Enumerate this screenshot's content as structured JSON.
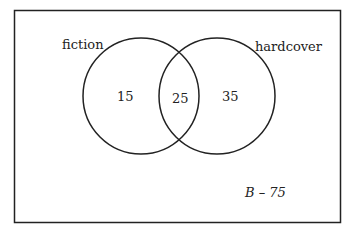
{
  "diagram": {
    "type": "venn",
    "sets": [
      {
        "label": "fiction",
        "only_value": "15"
      },
      {
        "label": "hardcover",
        "only_value": "35"
      }
    ],
    "intersection_value": "25",
    "outside_label": "B – 75"
  }
}
